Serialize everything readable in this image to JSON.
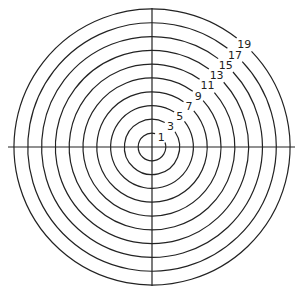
{
  "diagram": {
    "type": "concentric-circles",
    "center": [
      152,
      147
    ],
    "ring_spacing": 13.8,
    "stroke_color": "#222222",
    "axes": {
      "horizontal": {
        "x1": 8,
        "x2": 295,
        "y": 147
      },
      "vertical": {
        "x": 152,
        "y1": 8,
        "y2": 286
      }
    },
    "rings": [
      {
        "label": "1",
        "radius": 13.8
      },
      {
        "label": "3",
        "radius": 27.6
      },
      {
        "label": "5",
        "radius": 41.4
      },
      {
        "label": "7",
        "radius": 55.2
      },
      {
        "label": "9",
        "radius": 69.0
      },
      {
        "label": "11",
        "radius": 82.8
      },
      {
        "label": "13",
        "radius": 96.6
      },
      {
        "label": "15",
        "radius": 110.4
      },
      {
        "label": "17",
        "radius": 124.2
      },
      {
        "label": "19",
        "radius": 138.0
      }
    ]
  }
}
